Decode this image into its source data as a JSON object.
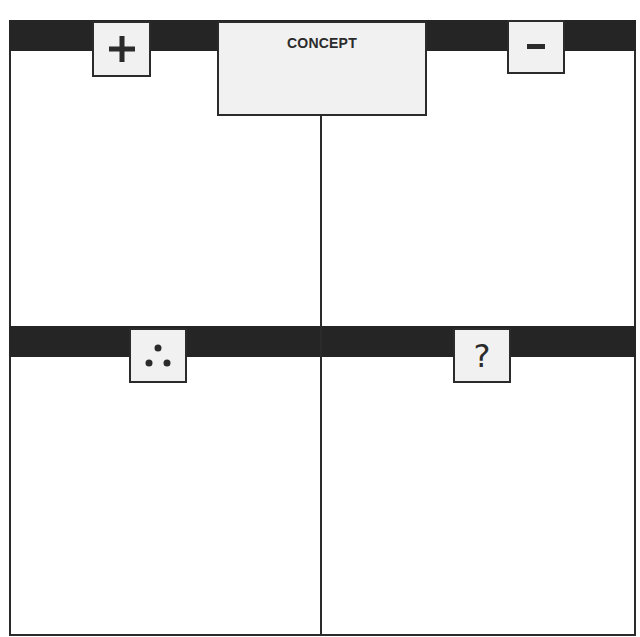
{
  "diagram": {
    "title": "CONCEPT",
    "quadrants": [
      {
        "position": "top-left",
        "symbol": "+",
        "icon": "plus-icon",
        "meaning": "positive"
      },
      {
        "position": "top-right",
        "symbol": "-",
        "icon": "minus-icon",
        "meaning": "negative"
      },
      {
        "position": "bottom-left",
        "symbol": "∴",
        "icon": "therefore-icon",
        "meaning": "therefore"
      },
      {
        "position": "bottom-right",
        "symbol": "?",
        "icon": "question-icon",
        "meaning": "question"
      }
    ],
    "colors": {
      "bar": "#252525",
      "box_fill": "#f1f1f1",
      "line": "#2b2b2b",
      "background": "#ffffff"
    }
  }
}
